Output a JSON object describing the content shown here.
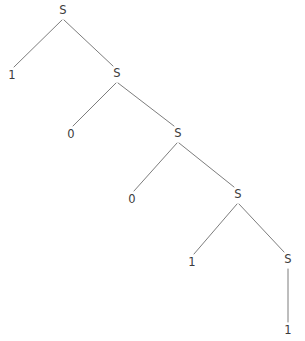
{
  "figure": {
    "name": "derivation-tree",
    "width": 305,
    "height": 341,
    "background_color": "#ffffff",
    "edge_color": "#7d7d7d",
    "edge_width": 1,
    "text_color": "#3b3b3b"
  },
  "nodes": [
    {
      "id": "s1",
      "label": "S",
      "type": "nonterminal",
      "x": 63,
      "y": 11
    },
    {
      "id": "t1",
      "label": "1",
      "type": "terminal",
      "x": 12,
      "y": 76
    },
    {
      "id": "s2",
      "label": "S",
      "type": "nonterminal",
      "x": 117,
      "y": 74
    },
    {
      "id": "t2",
      "label": "0",
      "type": "terminal",
      "x": 71,
      "y": 135
    },
    {
      "id": "s3",
      "label": "S",
      "type": "nonterminal",
      "x": 178,
      "y": 134
    },
    {
      "id": "t3",
      "label": "0",
      "type": "terminal",
      "x": 132,
      "y": 200
    },
    {
      "id": "s4",
      "label": "S",
      "type": "nonterminal",
      "x": 238,
      "y": 195
    },
    {
      "id": "t4",
      "label": "1",
      "type": "terminal",
      "x": 192,
      "y": 263
    },
    {
      "id": "s5",
      "label": "S",
      "type": "nonterminal",
      "x": 288,
      "y": 260
    },
    {
      "id": "t5",
      "label": "1",
      "type": "terminal",
      "x": 288,
      "y": 331
    }
  ],
  "edges": [
    {
      "from": "s1",
      "to": "t1",
      "x1": 62,
      "y1": 20,
      "x2": 14,
      "y2": 67
    },
    {
      "from": "s1",
      "to": "s2",
      "x1": 64,
      "y1": 20,
      "x2": 113,
      "y2": 66
    },
    {
      "from": "s2",
      "to": "t2",
      "x1": 116,
      "y1": 83,
      "x2": 73,
      "y2": 126
    },
    {
      "from": "s2",
      "to": "s3",
      "x1": 118,
      "y1": 83,
      "x2": 174,
      "y2": 126
    },
    {
      "from": "s3",
      "to": "t3",
      "x1": 177,
      "y1": 143,
      "x2": 134,
      "y2": 191
    },
    {
      "from": "s3",
      "to": "s4",
      "x1": 179,
      "y1": 143,
      "x2": 234,
      "y2": 187
    },
    {
      "from": "s4",
      "to": "t4",
      "x1": 237,
      "y1": 204,
      "x2": 194,
      "y2": 254
    },
    {
      "from": "s4",
      "to": "s5",
      "x1": 239,
      "y1": 204,
      "x2": 284,
      "y2": 252
    },
    {
      "from": "s5",
      "to": "t5",
      "x1": 288,
      "y1": 269,
      "x2": 288,
      "y2": 322
    }
  ],
  "derived_string": "10011"
}
